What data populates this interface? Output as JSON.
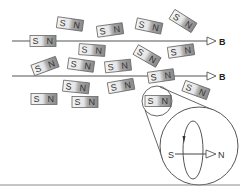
{
  "diagram": {
    "field_lines": [
      {
        "y": 41,
        "x_start": 12,
        "x_end": 216,
        "label": "B"
      },
      {
        "y": 76,
        "x_start": 12,
        "x_end": 216,
        "label": "B"
      }
    ],
    "magnet_labels": {
      "south": "S",
      "north": "N"
    },
    "magnets": [
      {
        "cx": 70,
        "cy": 24,
        "rot": 8
      },
      {
        "cx": 110,
        "cy": 30,
        "rot": -8
      },
      {
        "cx": 149,
        "cy": 26,
        "rot": 12
      },
      {
        "cx": 183,
        "cy": 21,
        "rot": 32
      },
      {
        "cx": 43,
        "cy": 41,
        "rot": 0
      },
      {
        "cx": 92,
        "cy": 50,
        "rot": 4
      },
      {
        "cx": 147,
        "cy": 56,
        "rot": 30
      },
      {
        "cx": 181,
        "cy": 51,
        "rot": -8
      },
      {
        "cx": 45,
        "cy": 66,
        "rot": -20
      },
      {
        "cx": 81,
        "cy": 65,
        "rot": 8
      },
      {
        "cx": 118,
        "cy": 66,
        "rot": -6
      },
      {
        "cx": 161,
        "cy": 76,
        "rot": -8
      },
      {
        "cx": 76,
        "cy": 87,
        "rot": 6
      },
      {
        "cx": 121,
        "cy": 86,
        "rot": -10
      },
      {
        "cx": 196,
        "cy": 90,
        "rot": 20
      },
      {
        "cx": 44,
        "cy": 99,
        "rot": 0
      },
      {
        "cx": 85,
        "cy": 102,
        "rot": 0
      },
      {
        "cx": 158,
        "cy": 101,
        "rot": 0
      }
    ],
    "magnifier": {
      "small_circle": {
        "cx": 157,
        "cy": 101,
        "r": 15
      },
      "large_circle": {
        "cx": 199,
        "cy": 146,
        "r": 39
      },
      "dipole": {
        "south_label": "S",
        "north_label": "N"
      }
    },
    "colors": {
      "stroke": "#555555",
      "magnet_south_fill": "#f2f2f2",
      "magnet_north_fill": "#9a9a9a",
      "baseline": "#888888"
    }
  }
}
